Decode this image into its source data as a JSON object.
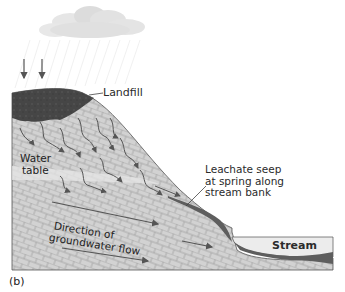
{
  "figure": {
    "panel_label": "(b)",
    "labels": {
      "landfill": "Landfill",
      "leachate": [
        "Leachate seep",
        "at spring along",
        "stream bank"
      ],
      "water_table": [
        "Water",
        "table"
      ],
      "groundwater_flow": [
        "Direction of",
        "groundwater flow"
      ],
      "stream": "Stream"
    },
    "elements": {
      "cloud": "rain-cloud",
      "rain_arrows": 2,
      "leachate_arrows": "wavy-downward-arrows",
      "flow_arrows": "straight-arrows-toward-stream"
    },
    "colors": {
      "landfill": "#4a4a4a",
      "ground_fill": "#cfcfcf",
      "ground_pattern": "#9a9a9a",
      "water_table_band": "#e4e4e4",
      "leachate_plume": "#5e5e5e",
      "stream_water": "#ebebeb",
      "outline": "#555555",
      "arrow": "#555555"
    }
  }
}
